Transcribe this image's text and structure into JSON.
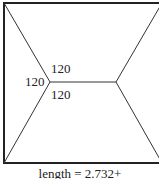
{
  "diagram": {
    "type": "steiner-tree-in-square",
    "angle_labels": [
      "120",
      "120",
      "120"
    ],
    "caption": "length = 2.732+",
    "colors": {
      "line": "#222222",
      "background": "#ffffff"
    }
  }
}
